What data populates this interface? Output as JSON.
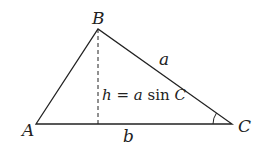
{
  "diagram": {
    "vertices": {
      "A": {
        "label": "A",
        "x": 36,
        "y": 124
      },
      "B": {
        "label": "B",
        "x": 98,
        "y": 29
      },
      "C": {
        "label": "C",
        "x": 232,
        "y": 124
      }
    },
    "sides": {
      "a": {
        "label": "a",
        "from": "B",
        "to": "C"
      },
      "b": {
        "label": "b",
        "from": "A",
        "to": "C"
      }
    },
    "height": {
      "label_var": "h",
      "label_eq": " = ",
      "label_a": "a",
      "label_sin": " sin ",
      "label_C": "C",
      "style": "dashed"
    },
    "angle_marker": {
      "at": "C"
    },
    "colors": {
      "stroke": "#222222",
      "background": "#ffffff"
    }
  }
}
